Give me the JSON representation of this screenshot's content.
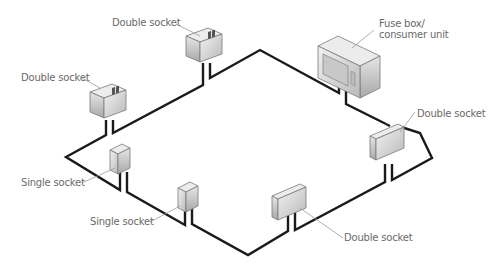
{
  "diagram": {
    "labels": {
      "double_socket_top": "Double socket",
      "double_socket_left": "Double socket",
      "fuse_box_line1": "Fuse box/",
      "fuse_box_line2": "consumer unit",
      "double_socket_right": "Double socket",
      "single_socket_1": "Single socket",
      "single_socket_2": "Single socket",
      "double_socket_bottom": "Double socket"
    },
    "components": [
      {
        "type": "double-socket",
        "label": "Double socket",
        "position": "top"
      },
      {
        "type": "fuse-box",
        "label": "Fuse box/ consumer unit",
        "position": "top-right"
      },
      {
        "type": "double-socket",
        "label": "Double socket",
        "position": "left"
      },
      {
        "type": "double-socket",
        "label": "Double socket",
        "position": "right"
      },
      {
        "type": "single-socket",
        "label": "Single socket",
        "position": "lower-left"
      },
      {
        "type": "single-socket",
        "label": "Single socket",
        "position": "bottom-left"
      },
      {
        "type": "double-socket",
        "label": "Double socket",
        "position": "bottom"
      }
    ],
    "colors": {
      "wire": "#1a1a1a",
      "label_text": "#6a6a6a",
      "leader_line": "#9a9a9a",
      "box_face": "#d8d8d8",
      "box_top": "#eeeeee",
      "box_side": "#bdbdbd"
    }
  }
}
